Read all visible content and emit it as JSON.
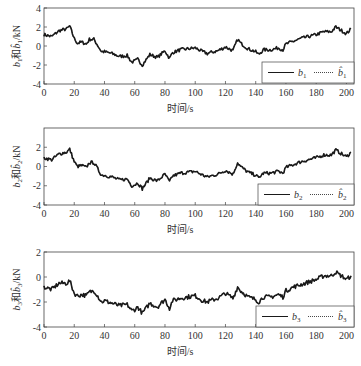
{
  "chart_data": [
    {
      "type": "line",
      "title": "",
      "xlabel": "时间/s",
      "ylabel": "b1和b̂1/kN",
      "xlim": [
        0,
        205
      ],
      "ylim": [
        -4,
        4
      ],
      "xticks": [
        0,
        20,
        40,
        60,
        80,
        100,
        120,
        140,
        160,
        180,
        200
      ],
      "yticks": [
        -4,
        -2,
        0,
        2,
        4
      ],
      "legend": {
        "position": "lower right",
        "entries": [
          "b1",
          "b̂1"
        ]
      },
      "series": [
        {
          "name": "b1",
          "style": "solid"
        },
        {
          "name": "b̂1",
          "style": "dotted"
        }
      ],
      "x": [
        0,
        5,
        10,
        15,
        17,
        20,
        22,
        25,
        28,
        30,
        33,
        35,
        38,
        40,
        45,
        50,
        55,
        58,
        60,
        62,
        65,
        70,
        75,
        80,
        83,
        85,
        90,
        95,
        100,
        105,
        108,
        110,
        115,
        120,
        125,
        128,
        130,
        135,
        140,
        142,
        145,
        150,
        155,
        158,
        160,
        165,
        170,
        175,
        180,
        185,
        190,
        193,
        195,
        198,
        200,
        203
      ],
      "values": [
        1.2,
        1.0,
        1.6,
        1.8,
        2.1,
        0.8,
        0.3,
        0.4,
        0.2,
        0.7,
        0.7,
        0.2,
        -0.6,
        -0.6,
        -0.8,
        -1.1,
        -1.0,
        -1.7,
        -1.6,
        -1.4,
        -2.0,
        -0.9,
        -1.2,
        -0.5,
        -1.3,
        -0.7,
        -0.4,
        -0.3,
        -0.2,
        -0.6,
        -0.8,
        -0.7,
        -0.5,
        -0.1,
        -0.5,
        0.7,
        0.3,
        -0.3,
        -0.6,
        -0.9,
        -0.4,
        -0.4,
        -0.2,
        -0.4,
        0.2,
        0.5,
        0.8,
        1.0,
        1.2,
        1.5,
        1.5,
        2.0,
        1.8,
        1.5,
        1.3,
        1.8
      ]
    },
    {
      "type": "line",
      "title": "",
      "xlabel": "时间/s",
      "ylabel": "b2和b̂2/kN",
      "xlim": [
        0,
        205
      ],
      "ylim": [
        -4,
        4
      ],
      "xticks": [
        0,
        20,
        40,
        60,
        80,
        100,
        120,
        140,
        160,
        180,
        200
      ],
      "yticks": [
        -4,
        -2,
        0,
        2
      ],
      "legend": {
        "position": "lower right",
        "entries": [
          "b2",
          "b̂2"
        ]
      },
      "series": [
        {
          "name": "b2",
          "style": "solid"
        },
        {
          "name": "b̂2",
          "style": "dotted"
        }
      ],
      "x": [
        0,
        5,
        10,
        15,
        17,
        20,
        22,
        25,
        28,
        30,
        33,
        35,
        38,
        40,
        45,
        50,
        55,
        58,
        60,
        62,
        65,
        70,
        75,
        80,
        83,
        85,
        90,
        95,
        100,
        105,
        108,
        110,
        115,
        120,
        125,
        128,
        130,
        135,
        140,
        142,
        145,
        150,
        155,
        158,
        160,
        165,
        170,
        175,
        180,
        185,
        190,
        193,
        195,
        198,
        200,
        203
      ],
      "values": [
        0.9,
        0.7,
        1.3,
        1.5,
        1.8,
        0.5,
        0.0,
        0.1,
        -0.1,
        0.4,
        0.4,
        -0.1,
        -0.9,
        -0.9,
        -1.1,
        -1.4,
        -1.3,
        -2.0,
        -1.9,
        -1.7,
        -2.3,
        -1.2,
        -1.5,
        -0.8,
        -1.6,
        -1.0,
        -0.7,
        -0.6,
        -0.5,
        -0.9,
        -1.1,
        -1.0,
        -0.8,
        -0.4,
        -0.8,
        0.4,
        0.0,
        -0.6,
        -0.9,
        -1.2,
        -0.7,
        -0.7,
        -0.5,
        -0.7,
        -0.1,
        0.2,
        0.5,
        0.7,
        0.9,
        1.2,
        1.2,
        1.7,
        1.5,
        1.2,
        1.0,
        1.5
      ]
    },
    {
      "type": "line",
      "title": "",
      "xlabel": "时间/s",
      "ylabel": "b3和b̂3/kN",
      "xlim": [
        0,
        205
      ],
      "ylim": [
        -4,
        2
      ],
      "xticks": [
        0,
        20,
        40,
        60,
        80,
        100,
        120,
        140,
        160,
        180,
        200
      ],
      "yticks": [
        -4,
        -2,
        0,
        2
      ],
      "legend": {
        "position": "lower right",
        "entries": [
          "b3",
          "b̂3"
        ]
      },
      "series": [
        {
          "name": "b3",
          "style": "solid"
        },
        {
          "name": "b̂3",
          "style": "dotted"
        }
      ],
      "x": [
        0,
        5,
        10,
        15,
        17,
        20,
        22,
        25,
        28,
        30,
        33,
        35,
        38,
        40,
        45,
        50,
        55,
        58,
        60,
        62,
        65,
        70,
        75,
        80,
        83,
        85,
        90,
        95,
        100,
        105,
        108,
        110,
        115,
        120,
        125,
        128,
        130,
        135,
        140,
        142,
        145,
        150,
        155,
        158,
        160,
        165,
        170,
        175,
        180,
        185,
        190,
        193,
        195,
        198,
        200,
        203
      ],
      "values": [
        -0.8,
        -1.0,
        -0.5,
        -0.5,
        -0.3,
        -1.3,
        -1.5,
        -1.4,
        -1.5,
        -1.2,
        -1.1,
        -1.4,
        -2.0,
        -1.9,
        -2.1,
        -2.3,
        -2.2,
        -2.7,
        -2.6,
        -2.4,
        -2.9,
        -2.1,
        -2.4,
        -1.8,
        -2.5,
        -1.9,
        -1.7,
        -1.6,
        -1.5,
        -1.9,
        -2.0,
        -1.9,
        -1.7,
        -1.3,
        -1.7,
        -0.8,
        -1.1,
        -1.6,
        -1.8,
        -2.0,
        -1.6,
        -1.6,
        -1.4,
        -1.6,
        -1.1,
        -0.8,
        -0.6,
        -0.4,
        -0.2,
        0.1,
        0.1,
        0.4,
        0.2,
        0.0,
        -0.2,
        0.1
      ]
    }
  ],
  "panels": [
    {
      "ylabel_main": "b",
      "ylabel_sub": "1",
      "ylabel_mid": "和",
      "ylabel_hat": "b̂",
      "ylabel_unit": "/kN",
      "xlabel": "时间/s",
      "legend_solid": "b",
      "legend_solid_sub": "1",
      "legend_dotted": "b̂",
      "legend_dotted_sub": "1"
    },
    {
      "ylabel_main": "b",
      "ylabel_sub": "2",
      "ylabel_mid": "和",
      "ylabel_hat": "b̂",
      "ylabel_unit": "/kN",
      "xlabel": "时间/s",
      "legend_solid": "b",
      "legend_solid_sub": "2",
      "legend_dotted": "b̂",
      "legend_dotted_sub": "2"
    },
    {
      "ylabel_main": "b",
      "ylabel_sub": "3",
      "ylabel_mid": "和",
      "ylabel_hat": "b̂",
      "ylabel_unit": "/kN",
      "xlabel": "时间/s",
      "legend_solid": "b",
      "legend_solid_sub": "3",
      "legend_dotted": "b̂",
      "legend_dotted_sub": "3"
    }
  ],
  "colors": {
    "line": "#1a1a1a",
    "axis": "#444444",
    "background": "#ffffff"
  }
}
